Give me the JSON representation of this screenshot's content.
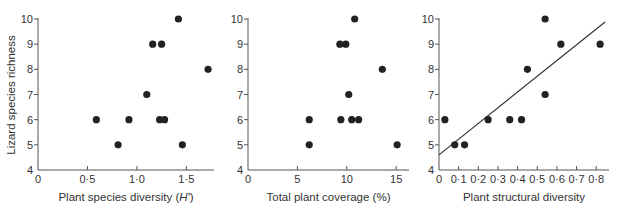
{
  "figure": {
    "y_axis_title": "Lizard species richness"
  },
  "chart_data": [
    {
      "type": "scatter",
      "title": "",
      "xlabel": "Plant species diversity (H′)",
      "xlabel_parts": {
        "prefix": "Plant species diversity (",
        "italic": "H′",
        "suffix": ")"
      },
      "ylabel": "Lizard species richness",
      "xlim": [
        0,
        1.78
      ],
      "ylim": [
        4,
        10
      ],
      "x_ticks": [
        0,
        0.5,
        1.0,
        1.5
      ],
      "x_tick_labels": [
        "0",
        "0·5",
        "1·0",
        "1·5"
      ],
      "y_ticks": [
        4,
        5,
        6,
        7,
        8,
        9,
        10
      ],
      "y_tick_labels": [
        "4",
        "5",
        "6",
        "7",
        "8",
        "9",
        "10"
      ],
      "grid": false,
      "points": [
        {
          "x": 1.42,
          "y": 10
        },
        {
          "x": 1.16,
          "y": 9
        },
        {
          "x": 1.25,
          "y": 9
        },
        {
          "x": 1.72,
          "y": 8
        },
        {
          "x": 1.1,
          "y": 7
        },
        {
          "x": 0.59,
          "y": 6
        },
        {
          "x": 0.92,
          "y": 6
        },
        {
          "x": 1.23,
          "y": 6
        },
        {
          "x": 1.28,
          "y": 6
        },
        {
          "x": 0.81,
          "y": 5
        },
        {
          "x": 1.46,
          "y": 5
        }
      ],
      "fit_line": null
    },
    {
      "type": "scatter",
      "title": "",
      "xlabel": "Total plant coverage (%)",
      "ylabel": "",
      "xlim": [
        0,
        16.3
      ],
      "ylim": [
        4,
        10
      ],
      "x_ticks": [
        0,
        5,
        10,
        15
      ],
      "x_tick_labels": [
        "0",
        "5",
        "10",
        "15"
      ],
      "y_ticks": [
        4,
        5,
        6,
        7,
        8,
        9,
        10
      ],
      "y_tick_labels": [
        "4",
        "5",
        "6",
        "7",
        "8",
        "9",
        "10"
      ],
      "grid": false,
      "points": [
        {
          "x": 10.8,
          "y": 10
        },
        {
          "x": 9.3,
          "y": 9
        },
        {
          "x": 9.9,
          "y": 9
        },
        {
          "x": 13.6,
          "y": 8
        },
        {
          "x": 10.2,
          "y": 7
        },
        {
          "x": 6.2,
          "y": 6
        },
        {
          "x": 9.4,
          "y": 6
        },
        {
          "x": 10.5,
          "y": 6
        },
        {
          "x": 11.2,
          "y": 6
        },
        {
          "x": 6.2,
          "y": 5
        },
        {
          "x": 15.1,
          "y": 5
        }
      ],
      "fit_line": null
    },
    {
      "type": "scatter",
      "title": "",
      "xlabel": "Plant structural diversity",
      "ylabel": "",
      "xlim": [
        0,
        0.865
      ],
      "ylim": [
        4,
        10
      ],
      "x_ticks": [
        0,
        0.1,
        0.2,
        0.3,
        0.4,
        0.5,
        0.6,
        0.7,
        0.8
      ],
      "x_tick_labels": [
        "0",
        "0·1",
        "0·2",
        "0·3",
        "0·4",
        "0·5",
        "0·6",
        "0·7",
        "0·8"
      ],
      "y_ticks": [
        4,
        5,
        6,
        7,
        8,
        9,
        10
      ],
      "y_tick_labels": [
        "4",
        "5",
        "6",
        "7",
        "8",
        "9",
        "10"
      ],
      "grid": false,
      "points": [
        {
          "x": 0.54,
          "y": 10
        },
        {
          "x": 0.62,
          "y": 9
        },
        {
          "x": 0.82,
          "y": 9
        },
        {
          "x": 0.45,
          "y": 8
        },
        {
          "x": 0.54,
          "y": 7
        },
        {
          "x": 0.03,
          "y": 6
        },
        {
          "x": 0.25,
          "y": 6
        },
        {
          "x": 0.36,
          "y": 6
        },
        {
          "x": 0.42,
          "y": 6
        },
        {
          "x": 0.08,
          "y": 5
        },
        {
          "x": 0.13,
          "y": 5
        }
      ],
      "fit_line": {
        "x0": 0,
        "y0": 4.6,
        "x1": 0.845,
        "y1": 9.88
      }
    }
  ],
  "layout": {
    "panels": [
      {
        "x0": 38,
        "x1": 214,
        "y_top": 19,
        "y_bottom": 170
      },
      {
        "x0": 248,
        "x1": 409,
        "y_top": 19,
        "y_bottom": 170
      },
      {
        "x0": 439,
        "x1": 609,
        "y_top": 19,
        "y_bottom": 170
      }
    ],
    "dot_radius": 3.6,
    "dot_color": "#222222"
  }
}
